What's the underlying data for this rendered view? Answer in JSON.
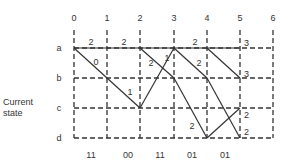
{
  "diagram": {
    "type": "trellis",
    "y_axis_title": [
      "Current",
      "state"
    ],
    "columns": [
      "0",
      "1",
      "2",
      "3",
      "4",
      "5",
      "6"
    ],
    "rows": [
      "a",
      "b",
      "c",
      "d"
    ],
    "inputs": [
      "11",
      "00",
      "11",
      "01",
      "01"
    ],
    "edges": [
      {
        "from": "a0",
        "to": "a1",
        "label": "2"
      },
      {
        "from": "a1",
        "to": "a2",
        "label": "2"
      },
      {
        "from": "a2",
        "to": "a3",
        "label": ""
      },
      {
        "from": "a3",
        "to": "a4",
        "label": "2"
      },
      {
        "from": "a4",
        "to": "a5",
        "label": ""
      },
      {
        "from": "a0",
        "to": "b1",
        "label": "0"
      },
      {
        "from": "b1",
        "to": "c2",
        "label": "1"
      },
      {
        "from": "c2",
        "to": "a3",
        "label": "1"
      },
      {
        "from": "a2",
        "to": "b3",
        "label": "2"
      },
      {
        "from": "b3",
        "to": "d4",
        "label": "2"
      },
      {
        "from": "a3",
        "to": "b4",
        "label": "2"
      },
      {
        "from": "b4",
        "to": "d5",
        "label": ""
      },
      {
        "from": "a4",
        "to": "b5",
        "label": ""
      },
      {
        "from": "d4",
        "to": "c5",
        "label": ""
      }
    ],
    "node_metrics": [
      {
        "node": "a5",
        "value": "3"
      },
      {
        "node": "b5",
        "value": "3"
      },
      {
        "node": "c5",
        "value": "2"
      },
      {
        "node": "d5",
        "value": "2"
      }
    ]
  }
}
